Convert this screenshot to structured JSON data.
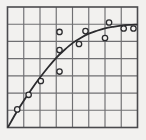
{
  "chart_data": {
    "type": "scatter",
    "title": "",
    "subtitle": "",
    "xlabel": "",
    "ylabel": "",
    "xlim": [
      0,
      8
    ],
    "ylim": [
      0,
      7
    ],
    "grid": true,
    "grid_x_divisions": 8,
    "grid_y_divisions": 7,
    "legend": "none",
    "x_tick_labels": [],
    "y_tick_labels": [],
    "annotations": [],
    "series": [
      {
        "name": "observations",
        "type": "scatter",
        "marker": "open-circle",
        "x": [
          0.6,
          1.3,
          2.05,
          3.2,
          3.2,
          3.2,
          4.4,
          4.8,
          6.0,
          6.25,
          7.15,
          7.75
        ],
        "y": [
          1.05,
          1.9,
          2.7,
          3.25,
          4.5,
          5.55,
          4.85,
          5.6,
          5.2,
          6.1,
          5.75,
          5.75
        ]
      },
      {
        "name": "fitted-curve",
        "type": "line",
        "x": [
          0.05,
          0.5,
          1.0,
          1.5,
          2.0,
          2.5,
          3.0,
          3.5,
          4.0,
          4.5,
          5.0,
          5.5,
          6.0,
          6.5,
          7.0,
          7.5,
          7.95
        ],
        "y": [
          0.05,
          0.8,
          1.55,
          2.25,
          2.9,
          3.5,
          4.05,
          4.5,
          4.9,
          5.2,
          5.45,
          5.62,
          5.76,
          5.85,
          5.92,
          5.96,
          5.98
        ]
      }
    ],
    "colors": {
      "background": "#f2f1ef",
      "grid_line": "#6f6f72",
      "axis_frame": "#4a4a4d",
      "curve": "#2b2b2e",
      "marker_stroke": "#2b2b2e",
      "marker_fill": "#f2f1ef"
    }
  },
  "figure": {
    "caption": ""
  }
}
